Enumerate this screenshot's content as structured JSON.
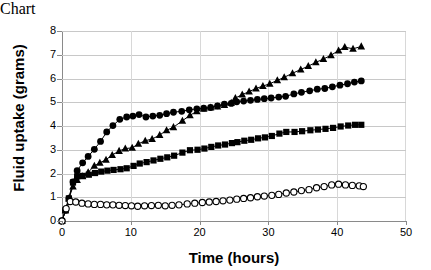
{
  "chart_data": {
    "type": "line",
    "title": "",
    "xlabel": "Time (hours)",
    "ylabel": "Fluid uptake (grams)",
    "xlim": [
      0,
      50
    ],
    "ylim": [
      0,
      8
    ],
    "xticks": [
      0,
      10,
      20,
      30,
      40,
      50
    ],
    "yticks": [
      0,
      1,
      2,
      3,
      4,
      5,
      6,
      7,
      8
    ],
    "grid": "horizontal",
    "legend": "none",
    "series": [
      {
        "name": "filled-triangle-series",
        "marker": "filled-triangle",
        "color": "#000000",
        "x": [
          0.0,
          0.5,
          1.0,
          1.6,
          2.2,
          3.0,
          3.8,
          4.7,
          5.5,
          6.4,
          7.3,
          8.3,
          9.2,
          10.2,
          11.1,
          12.1,
          13.1,
          14.2,
          15.2,
          16.2,
          17.5,
          18.6,
          19.6,
          20.6,
          21.6,
          22.6,
          23.6,
          24.6,
          25.2,
          26.2,
          27.2,
          28.2,
          29.2,
          30.2,
          31.3,
          32.3,
          33.5,
          34.7,
          35.8,
          36.9,
          38.0,
          39.1,
          40.2,
          41.1,
          42.3,
          43.5
        ],
        "y": [
          0.0,
          0.45,
          0.95,
          1.45,
          1.72,
          1.88,
          2.05,
          2.32,
          2.45,
          2.58,
          2.78,
          2.95,
          3.05,
          3.08,
          3.25,
          3.38,
          3.45,
          3.62,
          3.82,
          3.95,
          4.22,
          4.45,
          4.62,
          4.72,
          4.78,
          4.82,
          4.88,
          4.98,
          5.18,
          5.32,
          5.45,
          5.58,
          5.68,
          5.78,
          5.92,
          6.05,
          6.22,
          6.38,
          6.52,
          6.68,
          6.82,
          6.98,
          7.18,
          7.32,
          7.25,
          7.35
        ]
      },
      {
        "name": "filled-circle-series",
        "marker": "filled-circle",
        "color": "#000000",
        "x": [
          0.0,
          0.5,
          1.0,
          1.6,
          2.2,
          3.0,
          3.8,
          4.7,
          5.6,
          6.5,
          7.4,
          8.4,
          9.4,
          10.3,
          11.2,
          12.2,
          13.2,
          14.2,
          15.2,
          16.2,
          17.4,
          18.5,
          19.6,
          20.6,
          21.6,
          22.6,
          23.6,
          24.6,
          25.4,
          26.4,
          27.4,
          28.4,
          29.4,
          30.4,
          31.5,
          32.5,
          33.7,
          34.8,
          36.0,
          37.1,
          38.2,
          39.3,
          40.4,
          41.5,
          42.5,
          43.5
        ],
        "y": [
          0.0,
          0.45,
          0.95,
          1.65,
          2.12,
          2.45,
          2.72,
          3.02,
          3.35,
          3.75,
          4.02,
          4.28,
          4.38,
          4.42,
          4.48,
          4.38,
          4.42,
          4.45,
          4.52,
          4.58,
          4.62,
          4.68,
          4.72,
          4.75,
          4.78,
          4.85,
          4.92,
          4.95,
          5.02,
          5.05,
          5.08,
          5.12,
          5.15,
          5.18,
          5.22,
          5.25,
          5.35,
          5.42,
          5.48,
          5.55,
          5.58,
          5.65,
          5.72,
          5.78,
          5.85,
          5.9
        ]
      },
      {
        "name": "filled-square-series",
        "marker": "filled-square",
        "color": "#000000",
        "x": [
          0.0,
          0.5,
          1.0,
          1.6,
          2.2,
          3.0,
          3.9,
          4.8,
          5.7,
          6.6,
          7.5,
          8.5,
          9.4,
          10.4,
          11.3,
          12.3,
          13.3,
          14.3,
          15.3,
          16.3,
          17.5,
          18.6,
          19.7,
          20.7,
          21.7,
          22.7,
          23.7,
          24.7,
          25.5,
          26.5,
          27.5,
          28.5,
          29.5,
          30.5,
          31.6,
          32.6,
          33.8,
          34.9,
          36.1,
          37.2,
          38.3,
          39.4,
          40.5,
          41.6,
          42.6,
          43.5
        ],
        "y": [
          0.0,
          0.45,
          0.95,
          1.62,
          1.88,
          1.9,
          1.95,
          2.02,
          2.08,
          2.12,
          2.15,
          2.18,
          2.22,
          2.32,
          2.42,
          2.48,
          2.55,
          2.62,
          2.68,
          2.75,
          2.88,
          2.98,
          3.0,
          3.05,
          3.12,
          3.18,
          3.22,
          3.28,
          3.32,
          3.38,
          3.42,
          3.48,
          3.52,
          3.58,
          3.68,
          3.75,
          3.75,
          3.78,
          3.82,
          3.85,
          3.88,
          3.92,
          3.98,
          4.02,
          4.05,
          4.05
        ]
      },
      {
        "name": "open-circle-series",
        "marker": "open-circle",
        "color": "#000000",
        "x": [
          0.0,
          0.6,
          1.2,
          2.0,
          2.9,
          3.8,
          4.7,
          5.6,
          6.5,
          7.4,
          8.3,
          9.2,
          10.1,
          11.0,
          12.0,
          13.0,
          14.0,
          15.0,
          16.0,
          17.0,
          18.2,
          19.3,
          20.4,
          21.4,
          22.4,
          23.4,
          24.4,
          25.4,
          26.4,
          27.4,
          28.4,
          29.4,
          30.5,
          31.5,
          32.6,
          33.7,
          34.8,
          35.9,
          37.0,
          38.1,
          39.2,
          40.2,
          41.2,
          42.2,
          43.2,
          43.8
        ],
        "y": [
          0.0,
          0.52,
          0.82,
          0.8,
          0.75,
          0.72,
          0.7,
          0.7,
          0.68,
          0.68,
          0.66,
          0.65,
          0.64,
          0.62,
          0.64,
          0.65,
          0.66,
          0.64,
          0.66,
          0.68,
          0.72,
          0.75,
          0.78,
          0.8,
          0.82,
          0.85,
          0.88,
          0.92,
          0.95,
          0.98,
          1.02,
          1.05,
          1.08,
          1.12,
          1.18,
          1.22,
          1.28,
          1.32,
          1.4,
          1.45,
          1.52,
          1.55,
          1.52,
          1.5,
          1.48,
          1.45
        ]
      }
    ]
  },
  "axes": {
    "ylabel": "Fluid uptake (grams)",
    "xlabel": "Time (hours)",
    "ytick_labels": [
      "0",
      "1",
      "2",
      "3",
      "4",
      "5",
      "6",
      "7",
      "8"
    ],
    "xtick_labels": [
      "0",
      "10",
      "20",
      "30",
      "40",
      "50"
    ]
  },
  "colors": {
    "series": "#000000",
    "gridline": "#c8c8c8",
    "axis": "#8a8a8a",
    "background": "#ffffff"
  }
}
